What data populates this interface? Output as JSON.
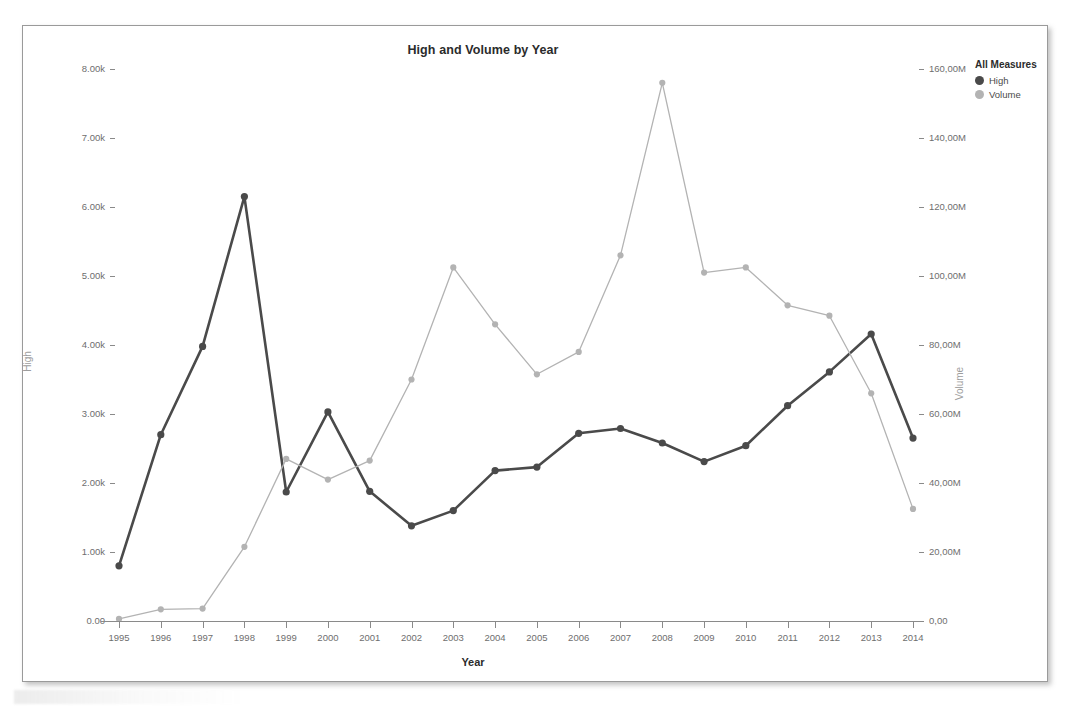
{
  "chart_data": {
    "type": "line",
    "title": "High and Volume by Year",
    "xlabel": "Year",
    "ylabel": "High",
    "y2label": "Volume",
    "grid": false,
    "legend_position": "right",
    "legend_title": "All Measures",
    "categories": [
      1995,
      1996,
      1997,
      1998,
      1999,
      2000,
      2001,
      2002,
      2003,
      2004,
      2005,
      2006,
      2007,
      2008,
      2009,
      2010,
      2011,
      2012,
      2013,
      2014
    ],
    "x_tick_labels": [
      "1995",
      "1996",
      "1997",
      "1998",
      "1999",
      "2000",
      "2001",
      "2002",
      "2003",
      "2004",
      "2005",
      "2006",
      "2007",
      "2008",
      "2009",
      "2010",
      "2011",
      "2012",
      "2013",
      "2014"
    ],
    "ylim": [
      0,
      8000
    ],
    "y_tick_labels": [
      "0.00",
      "1.00k",
      "2.00k",
      "3.00k",
      "4.00k",
      "5.00k",
      "6.00k",
      "7.00k",
      "8.00k"
    ],
    "y_tick_values": [
      0,
      1000,
      2000,
      3000,
      4000,
      5000,
      6000,
      7000,
      8000
    ],
    "y2lim": [
      0,
      160000000
    ],
    "y2_tick_labels": [
      "0,00",
      "20,00M",
      "40,00M",
      "60,00M",
      "80,00M",
      "100,00M",
      "120,00M",
      "140,00M",
      "160,00M"
    ],
    "y2_tick_values": [
      0,
      20000000,
      40000000,
      60000000,
      80000000,
      100000000,
      120000000,
      140000000,
      160000000
    ],
    "series": [
      {
        "name": "High",
        "axis": "left",
        "color": "#4a4a4a",
        "values": [
          800,
          2700,
          3980,
          6150,
          1870,
          3030,
          1880,
          1380,
          1600,
          2180,
          2230,
          2720,
          2790,
          2580,
          2310,
          2540,
          3120,
          3610,
          4160,
          2650
        ]
      },
      {
        "name": "Volume",
        "axis": "right",
        "color": "#b3b3b3",
        "values": [
          600000,
          3400000,
          3600000,
          21500000,
          47000000,
          41000000,
          46500000,
          70000000,
          102500000,
          86000000,
          71500000,
          78000000,
          106000000,
          156000000,
          101000000,
          102500000,
          91500000,
          88500000,
          66000000,
          32500000
        ]
      }
    ]
  },
  "legend": {
    "title": "All Measures",
    "entries": [
      {
        "label": "High",
        "color": "#4a4a4a"
      },
      {
        "label": "Volume",
        "color": "#b3b3b3"
      }
    ]
  }
}
